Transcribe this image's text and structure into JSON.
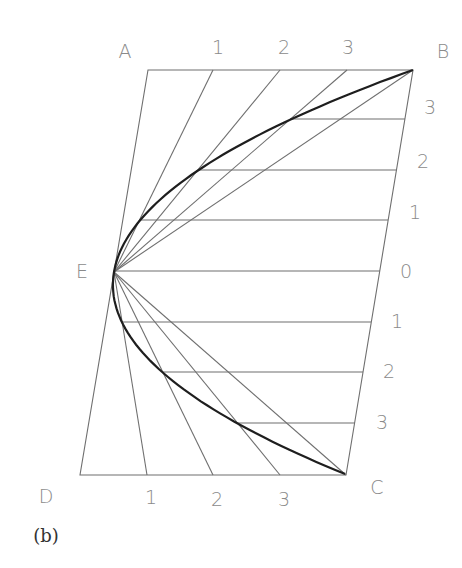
{
  "figure": {
    "caption": "(b)"
  },
  "colors": {
    "construction_line": "#6f6f6f",
    "curve": "#1e1e1e",
    "label": "#8a8a8a",
    "background": "#ffffff"
  },
  "vertices": {
    "A": {
      "label": "A",
      "x": 148,
      "y": 70,
      "label_x": 125,
      "label_y": 52
    },
    "B": {
      "label": "B",
      "x": 413,
      "y": 70,
      "label_x": 443,
      "label_y": 52
    },
    "C": {
      "label": "C",
      "x": 346,
      "y": 475,
      "label_x": 377,
      "label_y": 488
    },
    "D": {
      "label": "D",
      "x": 80,
      "y": 475,
      "label_x": 46,
      "label_y": 497
    },
    "E": {
      "label": "E",
      "x": 114,
      "y": 272,
      "label_x": 82,
      "label_y": 272
    }
  },
  "top_divisions": [
    {
      "label": "1",
      "x": 213,
      "y": 70,
      "label_x": 218,
      "label_y": 48
    },
    {
      "label": "2",
      "x": 280,
      "y": 70,
      "label_x": 284,
      "label_y": 48
    },
    {
      "label": "3",
      "x": 347,
      "y": 70,
      "label_x": 348,
      "label_y": 48
    }
  ],
  "bottom_divisions": [
    {
      "label": "1",
      "x": 147,
      "y": 475,
      "label_x": 151,
      "label_y": 498
    },
    {
      "label": "2",
      "x": 213,
      "y": 475,
      "label_x": 217,
      "label_y": 500
    },
    {
      "label": "3",
      "x": 280,
      "y": 475,
      "label_x": 284,
      "label_y": 500
    }
  ],
  "side_divisions": [
    {
      "label": "3",
      "y": 119,
      "curve_x": 290,
      "side_x": 405,
      "label_x": 430,
      "label_y": 108
    },
    {
      "label": "2",
      "y": 170,
      "curve_x": 198,
      "side_x": 396.5,
      "label_x": 423,
      "label_y": 162
    },
    {
      "label": "1",
      "y": 220,
      "curve_x": 139.5,
      "side_x": 388,
      "label_x": 415,
      "label_y": 213
    },
    {
      "label": "0",
      "y": 271,
      "curve_x": 114,
      "side_x": 380,
      "label_x": 406,
      "label_y": 272
    },
    {
      "label": "1",
      "y": 322,
      "curve_x": 122,
      "side_x": 371,
      "label_x": 397,
      "label_y": 322
    },
    {
      "label": "2",
      "y": 372,
      "curve_x": 163,
      "side_x": 363,
      "label_x": 389,
      "label_y": 372
    },
    {
      "label": "3",
      "y": 423,
      "curve_x": 237.5,
      "side_x": 355,
      "label_x": 382,
      "label_y": 423
    }
  ]
}
